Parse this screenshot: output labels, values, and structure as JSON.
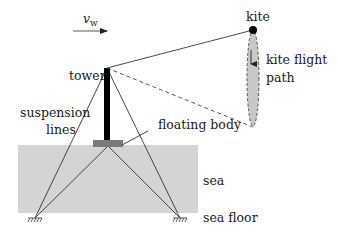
{
  "diagram": {
    "labels": {
      "wind_symbol": "v",
      "wind_subscript": "w",
      "kite": "kite",
      "kite_flight_path_line1": "kite flight",
      "kite_flight_path_line2": "path",
      "tower": "tower",
      "suspension_lines_line1": "suspension",
      "suspension_lines_line2": "lines",
      "floating_body": "floating body",
      "sea": "sea",
      "sea_floor": "sea floor"
    },
    "colors": {
      "sea": "#d4d4d4",
      "floating_body": "#7a7a7a",
      "tower": "#000000",
      "lines": "#333333",
      "flight_path_fill": "#c8c8c8",
      "kite": "#000000"
    },
    "elements": [
      {
        "id": "wind-arrow",
        "type": "arrow",
        "from": [
          73,
          31
        ],
        "to": [
          107,
          31
        ]
      },
      {
        "id": "kite",
        "type": "point",
        "at": [
          253,
          30
        ]
      },
      {
        "id": "tether",
        "type": "line",
        "from": [
          107,
          68
        ],
        "to": [
          253,
          30
        ],
        "style": "solid"
      },
      {
        "id": "tether-projection",
        "type": "line",
        "from": [
          107,
          68
        ],
        "to": [
          253,
          127
        ],
        "style": "dashed"
      },
      {
        "id": "flight-path",
        "type": "ellipse",
        "center": [
          253,
          78
        ],
        "rx": 6,
        "ry": 48
      },
      {
        "id": "tower",
        "type": "rect",
        "x": 104,
        "y": 68,
        "w": 6,
        "h": 74
      },
      {
        "id": "floating-body",
        "type": "rect",
        "x": 93,
        "y": 140,
        "w": 30,
        "h": 7
      },
      {
        "id": "sea",
        "type": "rect",
        "x": 18,
        "y": 145,
        "w": 180,
        "h": 68
      },
      {
        "id": "anchor-left",
        "type": "ground",
        "at": [
          35,
          218
        ]
      },
      {
        "id": "anchor-right",
        "type": "ground",
        "at": [
          180,
          218
        ]
      }
    ]
  }
}
